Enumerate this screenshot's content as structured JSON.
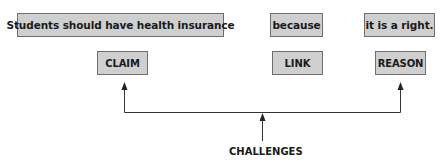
{
  "diagram": {
    "statements": {
      "claim_text": "Students should have health insurance",
      "link_text": "because",
      "reason_text": "it is a right."
    },
    "roles": {
      "claim": "CLAIM",
      "link": "LINK",
      "reason": "REASON"
    },
    "challenges_label": "CHALLENGES",
    "colors": {
      "box_fill": "#cfcfcf",
      "box_border": "#6e6e6e",
      "line": "#333333",
      "text": "#1a1a1a"
    }
  }
}
